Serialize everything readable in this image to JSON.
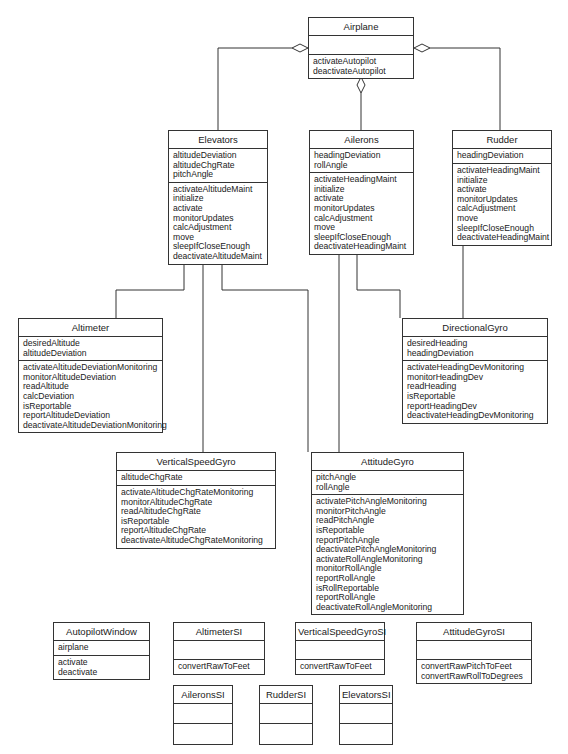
{
  "diagram": {
    "type": "uml-class-diagram",
    "classes": {
      "airplane": {
        "name": "Airplane",
        "attributes": [],
        "operations": [
          "activateAutopilot",
          "deactivateAutopilot"
        ]
      },
      "elevators": {
        "name": "Elevators",
        "attributes": [
          "altitudeDeviation",
          "altitudeChgRate",
          "pitchAngle"
        ],
        "operations": [
          "activateAltitudeMaint",
          "initialize",
          "activate",
          "monitorUpdates",
          "calcAdjustment",
          "move",
          "sleepIfCloseEnough",
          "deactivateAltitudeMaint"
        ]
      },
      "ailerons": {
        "name": "Ailerons",
        "attributes": [
          "headingDeviation",
          "rollAngle"
        ],
        "operations": [
          "activateHeadingMaint",
          "initialize",
          "activate",
          "monitorUpdates",
          "calcAdjustment",
          "move",
          "sleepIfCloseEnough",
          "deactivateHeadingMaint"
        ]
      },
      "rudder": {
        "name": "Rudder",
        "attributes": [
          "headingDeviation"
        ],
        "operations": [
          "activateHeadingMaint",
          "initialize",
          "activate",
          "monitorUpdates",
          "calcAdjustment",
          "move",
          "sleepIfCloseEnough",
          "deactivateHeadingMaint"
        ]
      },
      "altimeter": {
        "name": "Altimeter",
        "attributes": [
          "desiredAltitude",
          "altitudeDeviation"
        ],
        "operations": [
          "activateAltitudeDeviationMonitoring",
          "monitorAltitudeDeviation",
          "readAltitude",
          "calcDeviation",
          "isReportable",
          "reportAltitudeDeviation",
          "deactivateAltitudeDeviationMonitoring"
        ]
      },
      "directionalGyro": {
        "name": "DirectionalGyro",
        "attributes": [
          "desiredHeading",
          "headingDeviation"
        ],
        "operations": [
          "activateHeadingDevMonitoring",
          "monitorHeadingDev",
          "readHeading",
          "isReportable",
          "reportHeadingDev",
          "deactivateHeadingDevMonitoring"
        ]
      },
      "verticalSpeedGyro": {
        "name": "VerticalSpeedGyro",
        "attributes": [
          "altitudeChgRate"
        ],
        "operations": [
          "activateAltitudeChgRateMonitoring",
          "monitorAltitudeChgRate",
          "readAltitudeChgRate",
          "isReportable",
          "reportAltitudeChgRate",
          "deactivateAltitudeChgRateMonitoring"
        ]
      },
      "attitudeGyro": {
        "name": "AttitudeGyro",
        "attributes": [
          "pitchAngle",
          "rollAngle"
        ],
        "operations": [
          "activatePitchAngleMonitoring",
          "monitorPitchAngle",
          "readPitchAngle",
          "isReportable",
          "reportPitchAngle",
          "deactivatePitchAngleMonitoring",
          "activateRollAngleMonitoring",
          "monitorRollAngle",
          "reportRollAngle",
          "isRollReportable",
          "reportRollAngle",
          "deactivateRollAngleMonitoring"
        ]
      },
      "autopilotWindow": {
        "name": "AutopilotWindow",
        "attributes": [
          "airplane"
        ],
        "operations": [
          "activate",
          "deactivate"
        ]
      },
      "altimeterSI": {
        "name": "AltimeterSI",
        "attributes": [],
        "operations": [
          "convertRawToFeet"
        ]
      },
      "verticalSpeedGyroSI": {
        "name": "VerticalSpeedGyroSI",
        "attributes": [],
        "operations": [
          "convertRawToFeet"
        ]
      },
      "attitudeGyroSI": {
        "name": "AttitudeGyroSI",
        "attributes": [],
        "operations": [
          "convertRawPitchToFeet",
          "convertRawRollToDegrees"
        ]
      },
      "aileronsSI": {
        "name": "AileronsSI",
        "attributes": [],
        "operations": []
      },
      "rudderSI": {
        "name": "RudderSI",
        "attributes": [],
        "operations": []
      },
      "elevatorsSI": {
        "name": "ElevatorsSI",
        "attributes": [],
        "operations": []
      }
    },
    "relationships": [
      {
        "type": "aggregation",
        "whole": "Airplane",
        "part": "Elevators"
      },
      {
        "type": "aggregation",
        "whole": "Airplane",
        "part": "Ailerons"
      },
      {
        "type": "aggregation",
        "whole": "Airplane",
        "part": "Rudder"
      },
      {
        "type": "association",
        "from": "Elevators",
        "to": "Altimeter"
      },
      {
        "type": "association",
        "from": "Elevators",
        "to": "VerticalSpeedGyro"
      },
      {
        "type": "association",
        "from": "Elevators",
        "to": "AttitudeGyro"
      },
      {
        "type": "association",
        "from": "Ailerons",
        "to": "AttitudeGyro"
      },
      {
        "type": "association",
        "from": "Ailerons",
        "to": "DirectionalGyro"
      },
      {
        "type": "association",
        "from": "Rudder",
        "to": "DirectionalGyro"
      }
    ],
    "colors": {
      "line": "#333333",
      "background": "#ffffff",
      "text": "#1a1a1a"
    }
  }
}
